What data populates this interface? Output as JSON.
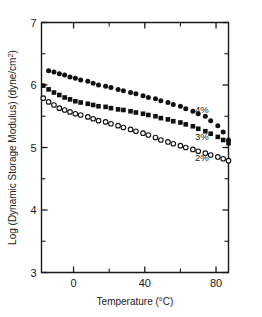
{
  "chart_data": {
    "type": "scatter",
    "title": "",
    "xlabel": "Temperature (°C)",
    "ylabel": "Log (Dynamic Storage Modulus) (dyne/cm²)",
    "ylabel_main": "Log (Dynamic Storage Modulus) (dyne/cm",
    "ylabel_sup": "2",
    "ylabel_tail": ")",
    "xlabel_main": "Temperature (",
    "xlabel_unit": "°C)",
    "xlim": [
      -18,
      87
    ],
    "ylim": [
      3,
      7
    ],
    "grid": false,
    "legend_position": "inline-right",
    "x_ticks_major": [
      0,
      40,
      80
    ],
    "x_tick_labels": [
      "0",
      "40",
      "80"
    ],
    "x_ticks_minor": [
      20,
      60
    ],
    "y_ticks_major": [
      3,
      4,
      5,
      6,
      7
    ],
    "y_tick_labels": [
      "3",
      "4",
      "5",
      "6",
      "7"
    ],
    "y_ticks_minor": [
      3.5,
      4.5,
      5.5,
      6.5
    ],
    "series": [
      {
        "name": "4%",
        "marker": "filled-circle",
        "label": "4%",
        "label_x": 72,
        "label_y": 5.55,
        "x": [
          -14,
          -11,
          -8,
          -5,
          -2,
          1,
          4,
          8,
          11,
          14,
          18,
          21,
          25,
          28,
          32,
          35,
          39,
          42,
          46,
          49,
          53,
          56,
          60,
          63,
          67,
          70,
          74,
          77,
          81,
          84,
          87
        ],
        "y": [
          6.23,
          6.21,
          6.18,
          6.16,
          6.13,
          6.11,
          6.08,
          6.06,
          6.03,
          6.0,
          5.98,
          5.96,
          5.93,
          5.91,
          5.88,
          5.86,
          5.83,
          5.8,
          5.78,
          5.75,
          5.72,
          5.69,
          5.66,
          5.62,
          5.58,
          5.54,
          5.5,
          5.43,
          5.35,
          5.25,
          5.12
        ]
      },
      {
        "name": "3%",
        "marker": "filled-square",
        "label": "3%",
        "label_x": 72,
        "label_y": 5.12,
        "x": [
          -17,
          -14,
          -11,
          -8,
          -5,
          -2,
          1,
          4,
          8,
          11,
          14,
          18,
          21,
          25,
          28,
          32,
          35,
          39,
          42,
          46,
          49,
          53,
          56,
          60,
          63,
          67,
          70,
          74,
          77,
          81,
          84,
          87
        ],
        "y": [
          5.99,
          5.93,
          5.88,
          5.84,
          5.8,
          5.77,
          5.74,
          5.72,
          5.7,
          5.68,
          5.66,
          5.65,
          5.63,
          5.61,
          5.6,
          5.58,
          5.56,
          5.54,
          5.52,
          5.5,
          5.47,
          5.45,
          5.42,
          5.4,
          5.37,
          5.34,
          5.3,
          5.26,
          5.22,
          5.17,
          5.12,
          5.07
        ]
      },
      {
        "name": "2%",
        "marker": "open-circle",
        "label": "2%",
        "label_x": 72,
        "label_y": 4.79,
        "x": [
          -17,
          -14,
          -11,
          -8,
          -5,
          -2,
          1,
          4,
          8,
          11,
          14,
          18,
          21,
          25,
          28,
          32,
          35,
          39,
          42,
          46,
          49,
          53,
          56,
          60,
          63,
          67,
          70,
          74,
          77,
          81,
          84,
          87
        ],
        "y": [
          5.79,
          5.73,
          5.68,
          5.63,
          5.6,
          5.57,
          5.54,
          5.52,
          5.49,
          5.46,
          5.43,
          5.41,
          5.38,
          5.35,
          5.32,
          5.29,
          5.26,
          5.23,
          5.2,
          5.16,
          5.12,
          5.09,
          5.06,
          5.03,
          5.0,
          4.97,
          4.94,
          4.91,
          4.88,
          4.85,
          4.82,
          4.79
        ]
      }
    ]
  }
}
